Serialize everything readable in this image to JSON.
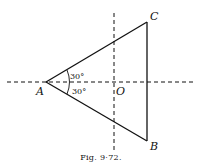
{
  "figure": {
    "caption": "Fig. 9·72.",
    "points": {
      "A": {
        "label": "A"
      },
      "B": {
        "label": "B"
      },
      "C": {
        "label": "C"
      },
      "O": {
        "label": "O"
      }
    },
    "angles": [
      {
        "label": "30°",
        "position": "upper"
      },
      {
        "label": "30°",
        "position": "lower"
      }
    ],
    "lines": {
      "triangle": "ABC",
      "axes": [
        "horizontal dashed through A and O",
        "vertical dashed through O"
      ]
    },
    "colors": {
      "stroke": "#111111",
      "background": "#ffffff"
    }
  }
}
